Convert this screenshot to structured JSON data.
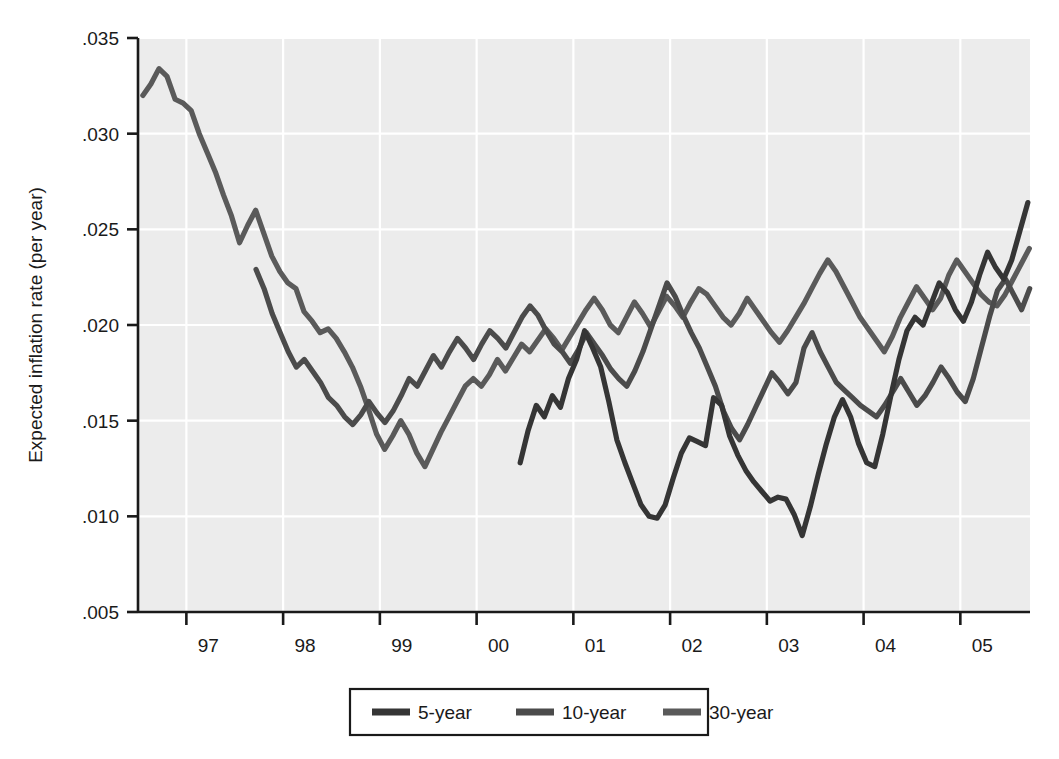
{
  "chart_data": {
    "type": "line",
    "title": "",
    "xlabel": "",
    "ylabel": "Expected inflation rate (per year)",
    "xlim": [
      1996.5,
      1905.6
    ],
    "ylim": [
      0.005,
      0.035
    ],
    "grid": true,
    "legend_position": "bottom-center",
    "y_ticks": [
      ".035",
      ".030",
      ".025",
      ".020",
      ".015",
      ".010",
      ".005"
    ],
    "y_tick_values": [
      0.035,
      0.03,
      0.025,
      0.02,
      0.015,
      0.01,
      0.005
    ],
    "x_ticks": [
      "97",
      "98",
      "99",
      "00",
      "01",
      "02",
      "03",
      "04",
      "05"
    ],
    "x_tick_values": [
      1997,
      1998,
      1999,
      2000,
      2001,
      2002,
      2003,
      2004,
      2005
    ],
    "x_axis_start": 1996.5,
    "x_axis_end": 2005.72,
    "series": [
      {
        "name": "5-year",
        "color": "#353535",
        "x_start": 2000.45,
        "x_step": 0.0833,
        "values": [
          0.0128,
          0.0145,
          0.0158,
          0.0152,
          0.0163,
          0.0157,
          0.0172,
          0.0182,
          0.0197,
          0.0188,
          0.0178,
          0.016,
          0.014,
          0.0128,
          0.0117,
          0.0106,
          0.01,
          0.0099,
          0.0106,
          0.012,
          0.0133,
          0.0141,
          0.0139,
          0.0137,
          0.0162,
          0.0158,
          0.0142,
          0.0132,
          0.0124,
          0.0118,
          0.0113,
          0.0108,
          0.011,
          0.0109,
          0.0101,
          0.009,
          0.0105,
          0.0122,
          0.0138,
          0.0152,
          0.0161,
          0.0152,
          0.0138,
          0.0128,
          0.0126,
          0.0143,
          0.0163,
          0.0182,
          0.0197,
          0.0204,
          0.02,
          0.0211,
          0.0222,
          0.0217,
          0.0208,
          0.0202,
          0.0212,
          0.0226,
          0.0238,
          0.023,
          0.0224,
          0.0234,
          0.0249,
          0.0264,
          0.0278,
          0.027,
          0.0258,
          0.0246,
          0.0238,
          0.0247,
          0.0262,
          0.0276,
          0.0289,
          0.0282,
          0.027,
          0.0259,
          0.0265,
          0.0277,
          0.0272,
          0.0262,
          0.0256,
          0.0249,
          0.0255,
          0.0262,
          0.0258,
          0.025,
          0.0256,
          0.0263,
          0.0257,
          0.0262,
          0.027,
          0.0264,
          0.0268,
          0.0274,
          0.0278
        ]
      },
      {
        "name": "10-year",
        "color": "#4b4b4b",
        "x_start": 1997.72,
        "x_step": 0.0833,
        "values": [
          0.0229,
          0.0219,
          0.0206,
          0.0196,
          0.0186,
          0.0178,
          0.0182,
          0.0176,
          0.017,
          0.0162,
          0.0158,
          0.0152,
          0.0148,
          0.0153,
          0.016,
          0.0154,
          0.0149,
          0.0155,
          0.0163,
          0.0172,
          0.0168,
          0.0176,
          0.0184,
          0.0178,
          0.0186,
          0.0193,
          0.0188,
          0.0182,
          0.019,
          0.0197,
          0.0193,
          0.0188,
          0.0196,
          0.0204,
          0.021,
          0.0205,
          0.0197,
          0.019,
          0.0186,
          0.018,
          0.0187,
          0.0196,
          0.019,
          0.0184,
          0.0177,
          0.0172,
          0.0168,
          0.0176,
          0.0186,
          0.0198,
          0.021,
          0.0222,
          0.0215,
          0.0205,
          0.0196,
          0.0188,
          0.0178,
          0.0168,
          0.0155,
          0.0146,
          0.014,
          0.0148,
          0.0157,
          0.0166,
          0.0175,
          0.017,
          0.0164,
          0.017,
          0.0188,
          0.0196,
          0.0186,
          0.0178,
          0.017,
          0.0166,
          0.0162,
          0.0158,
          0.0155,
          0.0152,
          0.0158,
          0.0165,
          0.0172,
          0.0165,
          0.0158,
          0.0163,
          0.017,
          0.0178,
          0.0172,
          0.0165,
          0.016,
          0.0172,
          0.0188,
          0.0204,
          0.0218,
          0.0224,
          0.0216,
          0.0208,
          0.0219,
          0.0231,
          0.0226,
          0.0218,
          0.021,
          0.0216,
          0.0224,
          0.0232,
          0.0243,
          0.0252,
          0.0246,
          0.0238,
          0.023,
          0.0238,
          0.0252,
          0.0266,
          0.028,
          0.0272,
          0.0262,
          0.0252,
          0.0244,
          0.0252,
          0.0264,
          0.0276,
          0.0288,
          0.028,
          0.0268,
          0.0258,
          0.0263,
          0.0272,
          0.0268,
          0.026,
          0.0254,
          0.0248,
          0.0254,
          0.0261,
          0.0256,
          0.0249,
          0.0255,
          0.0262,
          0.0256,
          0.0261,
          0.0269,
          0.0263,
          0.0267,
          0.0273,
          0.0277
        ]
      },
      {
        "name": "30-year",
        "color": "#5a5a5a",
        "x_start": 1996.55,
        "x_step": 0.0833,
        "values": [
          0.032,
          0.0326,
          0.0334,
          0.033,
          0.0318,
          0.0316,
          0.0312,
          0.03,
          0.029,
          0.028,
          0.0268,
          0.0257,
          0.0243,
          0.0252,
          0.026,
          0.0248,
          0.0236,
          0.0228,
          0.0222,
          0.0219,
          0.0207,
          0.0202,
          0.0196,
          0.0198,
          0.0193,
          0.0186,
          0.0178,
          0.0168,
          0.0156,
          0.0143,
          0.0135,
          0.0142,
          0.015,
          0.0143,
          0.0133,
          0.0126,
          0.0135,
          0.0144,
          0.0152,
          0.016,
          0.0168,
          0.0172,
          0.0168,
          0.0174,
          0.0182,
          0.0176,
          0.0183,
          0.019,
          0.0186,
          0.0192,
          0.0198,
          0.0193,
          0.0187,
          0.0194,
          0.0201,
          0.0208,
          0.0214,
          0.0208,
          0.02,
          0.0196,
          0.0204,
          0.0212,
          0.0206,
          0.0199,
          0.0207,
          0.0215,
          0.021,
          0.0204,
          0.0212,
          0.0219,
          0.0216,
          0.021,
          0.0204,
          0.02,
          0.0206,
          0.0214,
          0.0208,
          0.0202,
          0.0196,
          0.0191,
          0.0197,
          0.0204,
          0.0211,
          0.0219,
          0.0227,
          0.0234,
          0.0228,
          0.022,
          0.0212,
          0.0204,
          0.0198,
          0.0192,
          0.0186,
          0.0194,
          0.0204,
          0.0212,
          0.022,
          0.0214,
          0.0208,
          0.0214,
          0.0226,
          0.0234,
          0.0228,
          0.0222,
          0.0216,
          0.0212,
          0.021,
          0.0216,
          0.0224,
          0.0232,
          0.024,
          0.0233,
          0.0226,
          0.0232,
          0.0244,
          0.0252,
          0.0246,
          0.024,
          0.0234,
          0.024,
          0.025,
          0.0246,
          0.024,
          0.0247,
          0.0256,
          0.0264,
          0.0272,
          0.028,
          0.0288,
          0.0296,
          0.029,
          0.0283,
          0.0292,
          0.03,
          0.0306,
          0.0298,
          0.029,
          0.0283,
          0.0292,
          0.0285,
          0.0276,
          0.0268,
          0.026,
          0.0252,
          0.026,
          0.0272,
          0.0266,
          0.0256,
          0.0248,
          0.0256,
          0.0268,
          0.0278,
          0.0286,
          0.0278,
          0.0266,
          0.0256,
          0.0248,
          0.0256,
          0.0266,
          0.0274,
          0.0284,
          0.0276,
          0.0264,
          0.0256,
          0.0262,
          0.027,
          0.0266,
          0.0258,
          0.0252,
          0.0246,
          0.0252,
          0.0259,
          0.0254,
          0.0248,
          0.0253,
          0.026,
          0.0254,
          0.0259,
          0.0267,
          0.0262,
          0.0265,
          0.0271,
          0.0276
        ]
      }
    ]
  },
  "legend": {
    "items": [
      {
        "label": "5-year"
      },
      {
        "label": "10-year"
      },
      {
        "label": "30-year"
      }
    ]
  }
}
